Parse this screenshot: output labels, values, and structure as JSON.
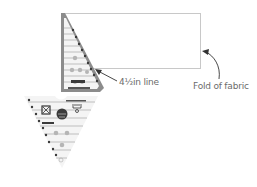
{
  "diagram": {
    "annotations": {
      "line_label": "4½in line",
      "fold_label": "Fold of fabric"
    },
    "colors": {
      "ruler_outline": "#8c8c8c",
      "ruler_fill": "#f2f2f2",
      "ruler_marks": "#3a3a3a",
      "ruler_dots": "#b5b5b5",
      "fabric_outline": "#c8c8c8",
      "arrow": "#333333",
      "text": "#6b6b6b"
    },
    "elements": {
      "fabric_rectangle": "folded fabric strip",
      "upper_ruler": "ruler half above fold",
      "lower_ruler": "triangle ruler below fold"
    }
  }
}
